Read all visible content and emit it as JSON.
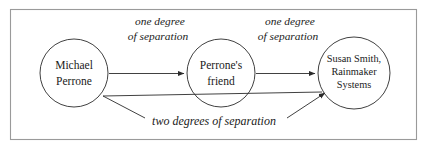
{
  "figure": {
    "frame": {
      "name": "outer-border",
      "color": "#9a9a9a"
    },
    "style": {
      "node_stroke": "#2b2b2b",
      "edge_stroke": "#2b2b2b",
      "background": "#ffffff",
      "text_color": "#1a1a1a"
    },
    "nodes": [
      {
        "id": "michael-perrone",
        "lines": [
          "Michael",
          "Perrone"
        ],
        "cx": 74,
        "cy": 73,
        "r": 34
      },
      {
        "id": "perrones-friend",
        "lines": [
          "Perrone's",
          "friend"
        ],
        "cx": 221,
        "cy": 73,
        "r": 34
      },
      {
        "id": "susan-smith-rainmaker-systems",
        "lines": [
          "Susan Smith,",
          "Rainmaker",
          "Systems"
        ],
        "cx": 354,
        "cy": 73,
        "r": 36
      }
    ],
    "edges": [
      {
        "id": "edge-michael-to-friend",
        "from": "michael-perrone",
        "to": "perrones-friend",
        "label_lines": [
          "one degree",
          "of separation"
        ],
        "label_x": 160,
        "label_y": 20
      },
      {
        "id": "edge-friend-to-susan",
        "from": "perrones-friend",
        "to": "susan-smith-rainmaker-systems",
        "label_lines": [
          "one degree",
          "of separation"
        ],
        "label_x": 289,
        "label_y": 20
      },
      {
        "id": "edge-michael-to-susan",
        "from": "michael-perrone",
        "to": "susan-smith-rainmaker-systems",
        "label_lines": [
          "two degrees of separation"
        ],
        "label_x": 214,
        "label_y": 122
      }
    ]
  }
}
